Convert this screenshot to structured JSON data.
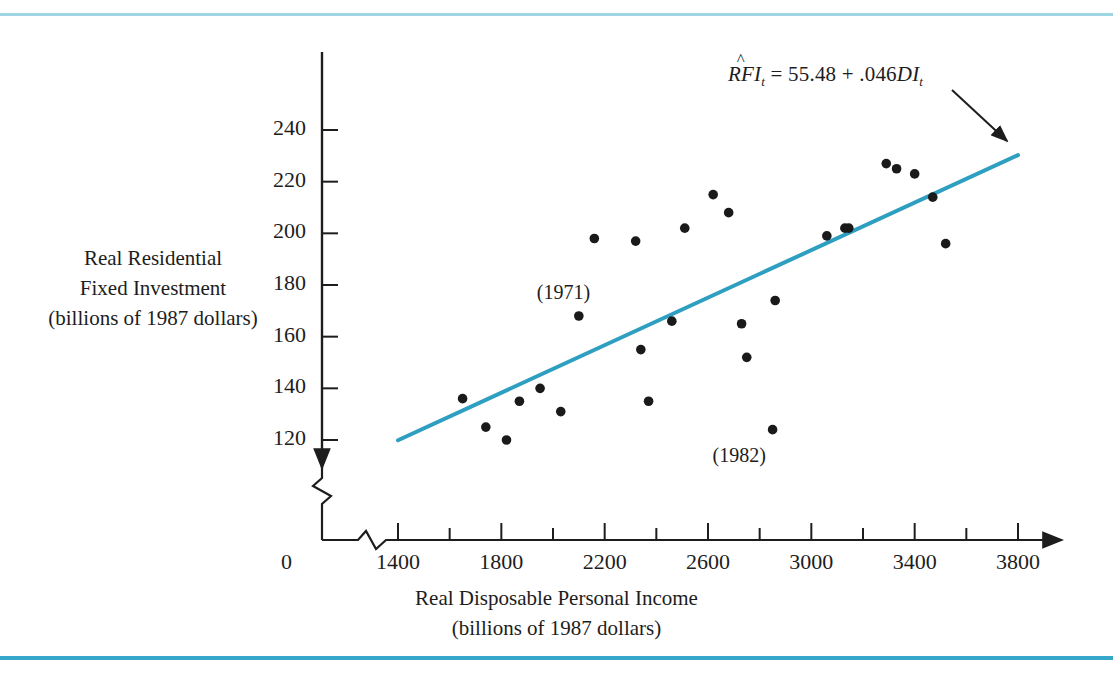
{
  "figure": {
    "background": "#ffffff",
    "rule_top_color": "#9fd6e4",
    "rule_bottom_color": "#35a8cc"
  },
  "equation": {
    "lhs_pre": "RF",
    "lhs_hat": "^",
    "lhs_post": "I",
    "lhs_sub": "t",
    "equals": " = ",
    "intercept": "55.48",
    "plus": " + ",
    "slope": ".046",
    "variable": "DI",
    "variable_sub": "t"
  },
  "annotations": [
    {
      "name": "label-1971",
      "text": "(1971)",
      "x": 2100,
      "y": 176
    },
    {
      "name": "label-1982",
      "text": "(1982)",
      "x": 2780,
      "y": 113
    }
  ],
  "chart_data": {
    "type": "scatter",
    "title": "",
    "xlabel": "Real Disposable Personal Income",
    "xlabel_sub": "(billions of 1987 dollars)",
    "ylabel_lines": [
      "Real Residential",
      "Fixed Investment",
      "(billions of 1987 dollars)"
    ],
    "xlim": [
      1400,
      3800
    ],
    "ylim": [
      110,
      252
    ],
    "xticks": [
      1400,
      1800,
      2200,
      2600,
      3000,
      3400,
      3800
    ],
    "xtick_labels": [
      "1400",
      "1800",
      "2200",
      "2600",
      "3000",
      "3400",
      "3800"
    ],
    "x_minor_step": 200,
    "yticks": [
      120,
      140,
      160,
      180,
      200,
      220,
      240
    ],
    "ytick_labels": [
      "120",
      "140",
      "160",
      "180",
      "200",
      "220",
      "240"
    ],
    "origin_label": "0",
    "axis_break_x": true,
    "axis_break_y": true,
    "grid": false,
    "legend": "none",
    "marker_color": "#1a1a1a",
    "marker_size": 6,
    "points": [
      {
        "x": 1650,
        "y": 136
      },
      {
        "x": 1740,
        "y": 125
      },
      {
        "x": 1820,
        "y": 120
      },
      {
        "x": 1870,
        "y": 135
      },
      {
        "x": 1950,
        "y": 140
      },
      {
        "x": 2030,
        "y": 131
      },
      {
        "x": 2100,
        "y": 168
      },
      {
        "x": 2160,
        "y": 198
      },
      {
        "x": 2320,
        "y": 197
      },
      {
        "x": 2340,
        "y": 155
      },
      {
        "x": 2370,
        "y": 135
      },
      {
        "x": 2460,
        "y": 166
      },
      {
        "x": 2510,
        "y": 202
      },
      {
        "x": 2620,
        "y": 215
      },
      {
        "x": 2680,
        "y": 208
      },
      {
        "x": 2730,
        "y": 165
      },
      {
        "x": 2750,
        "y": 152
      },
      {
        "x": 2860,
        "y": 174
      },
      {
        "x": 2850,
        "y": 124
      },
      {
        "x": 3060,
        "y": 199
      },
      {
        "x": 3130,
        "y": 202
      },
      {
        "x": 3145,
        "y": 202
      },
      {
        "x": 3290,
        "y": 227
      },
      {
        "x": 3330,
        "y": 225
      },
      {
        "x": 3400,
        "y": 223
      },
      {
        "x": 3470,
        "y": 214
      },
      {
        "x": 3520,
        "y": 196
      }
    ],
    "regression_line": {
      "color": "#2e9fc0",
      "intercept": 55.48,
      "slope": 0.046,
      "x_start": 1400,
      "x_end": 3800,
      "y_start": 119.9,
      "y_end": 230.3
    }
  }
}
